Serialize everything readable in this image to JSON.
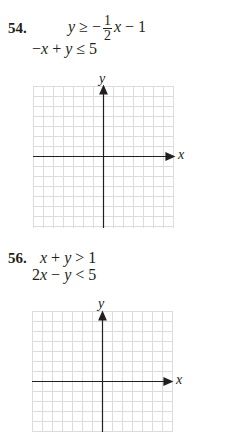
{
  "problems": [
    {
      "number": "54.",
      "line1": {
        "lhs": "y",
        "op": "≥",
        "neg": "−",
        "frac_num": "1",
        "frac_den": "2",
        "var": "x",
        "rest": "− 1"
      },
      "line2": {
        "text_a": "−",
        "var1": "x",
        "plus": "+",
        "var2": "y",
        "op": "≤",
        "rhs": "5"
      },
      "graph": {
        "x_label": "x",
        "y_label": "y"
      }
    },
    {
      "number": "56.",
      "line1": {
        "var1": "x",
        "plus": "+",
        "var2": "y",
        "op": ">",
        "rhs": "1"
      },
      "line2": {
        "coef": "2",
        "var1": "x",
        "minus": "−",
        "var2": "y",
        "op": "<",
        "rhs": "5"
      },
      "graph": {
        "x_label": "x",
        "y_label": "y"
      }
    }
  ],
  "colors": {
    "grid": "#d9d9d9",
    "axis": "#231f20",
    "text": "#231f20"
  }
}
